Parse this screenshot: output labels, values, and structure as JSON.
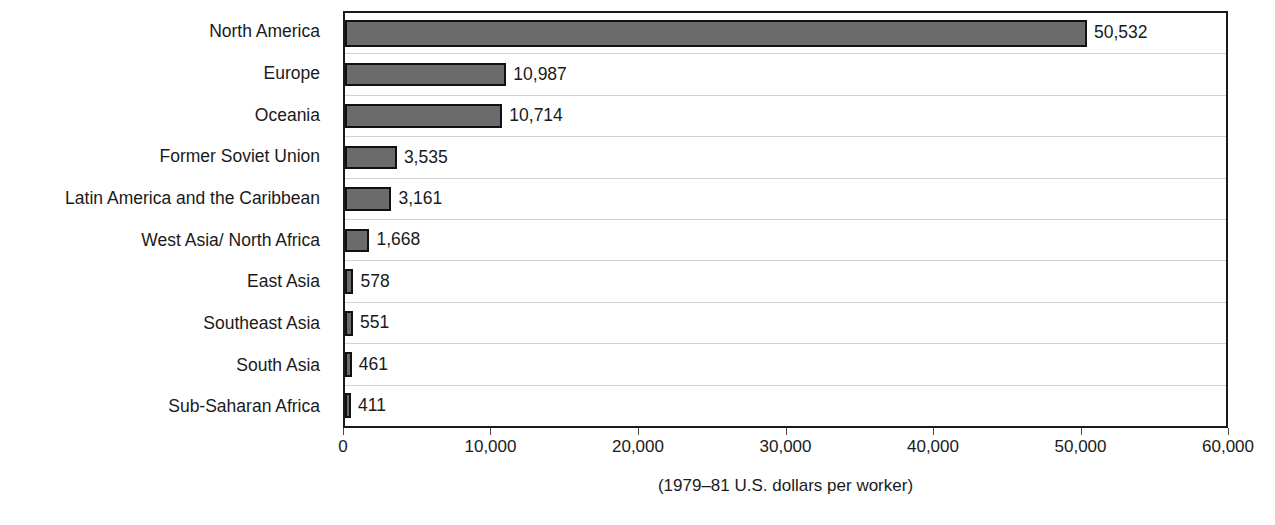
{
  "chart_data": {
    "type": "bar",
    "orientation": "horizontal",
    "title": "",
    "subtitle": "",
    "xlabel": "(1979–81 U.S. dollars per worker)",
    "ylabel": "",
    "xlim": [
      0,
      60000
    ],
    "xticks": [
      0,
      10000,
      20000,
      30000,
      40000,
      50000,
      60000
    ],
    "xtick_labels": [
      "0",
      "10,000",
      "20,000",
      "30,000",
      "40,000",
      "50,000",
      "60,000"
    ],
    "grid": "horizontal-row-separators",
    "legend": "none",
    "bar_color": "#6b6b6b",
    "bar_border_color": "#111111",
    "gridline_color": "#d2d2d2",
    "axis_color": "#1a1a1a",
    "categories": [
      "North America",
      "Europe",
      "Oceania",
      "Former Soviet Union",
      "Latin America and the Caribbean",
      "West Asia/ North Africa",
      "East Asia",
      "Southeast Asia",
      "South Asia",
      "Sub-Saharan Africa"
    ],
    "values": [
      50532,
      10987,
      10714,
      3535,
      3161,
      1668,
      578,
      551,
      461,
      411
    ],
    "value_labels": [
      "50,532",
      "10,987",
      "10,714",
      "3,535",
      "3,161",
      "1,668",
      "578",
      "551",
      "461",
      "411"
    ],
    "bars": [
      {
        "category": "North America",
        "value": 50532,
        "label": "50,532"
      },
      {
        "category": "Europe",
        "value": 10987,
        "label": "10,987"
      },
      {
        "category": "Oceania",
        "value": 10714,
        "label": "10,714"
      },
      {
        "category": "Former Soviet Union",
        "value": 3535,
        "label": "3,535"
      },
      {
        "category": "Latin America and the Caribbean",
        "value": 3161,
        "label": "3,161"
      },
      {
        "category": "West Asia/ North Africa",
        "value": 1668,
        "label": "1,668"
      },
      {
        "category": "East Asia",
        "value": 578,
        "label": "578"
      },
      {
        "category": "Southeast Asia",
        "value": 551,
        "label": "551"
      },
      {
        "category": "South Asia",
        "value": 461,
        "label": "461"
      },
      {
        "category": "Sub-Saharan Africa",
        "value": 411,
        "label": "411"
      }
    ]
  }
}
